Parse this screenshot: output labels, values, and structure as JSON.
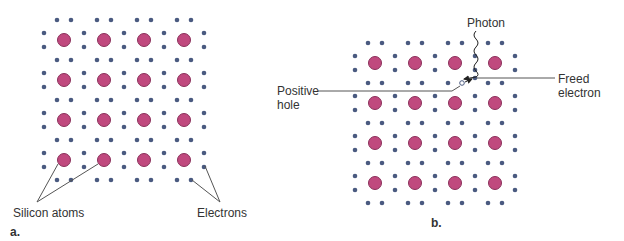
{
  "colors": {
    "atom_fill": "#c0497e",
    "atom_stroke": "#8a2f5a",
    "electron": "#4a5a80",
    "line": "#555555"
  },
  "panel_a": {
    "label": "a.",
    "annotations": {
      "silicon_atoms": "Silicon atoms",
      "electrons": "Electrons"
    },
    "grid": {
      "cols": 4,
      "rows": 4,
      "origin_x": 64,
      "origin_y": 40,
      "spacing": 40
    }
  },
  "panel_b": {
    "label": "b.",
    "annotations": {
      "photon": "Photon",
      "positive_hole": "Positive\nhole",
      "freed_electron": "Freed\nelectron"
    },
    "grid": {
      "cols": 4,
      "rows": 4,
      "origin_x": 375,
      "origin_y": 63,
      "spacing": 40
    },
    "hole": {
      "x": 462,
      "y": 83
    },
    "freed_electron_pos": {
      "x": 475,
      "y": 78
    }
  }
}
